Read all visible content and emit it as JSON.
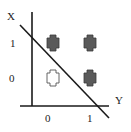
{
  "diagram": {
    "axes": {
      "vertical_label": "X",
      "horizontal_label": "Y",
      "vertical_ticks": [
        "1",
        "0"
      ],
      "horizontal_ticks": [
        "0",
        "1"
      ]
    },
    "points": [
      {
        "x": 0,
        "y": 1,
        "style": "filled"
      },
      {
        "x": 1,
        "y": 1,
        "style": "filled"
      },
      {
        "x": 0,
        "y": 0,
        "style": "outline"
      },
      {
        "x": 1,
        "y": 0,
        "style": "filled"
      }
    ],
    "separator": "diagonal line",
    "colors": {
      "filled": "#5a5a5a",
      "outline": "#ffffff",
      "stroke": "#1a1a1a"
    }
  }
}
